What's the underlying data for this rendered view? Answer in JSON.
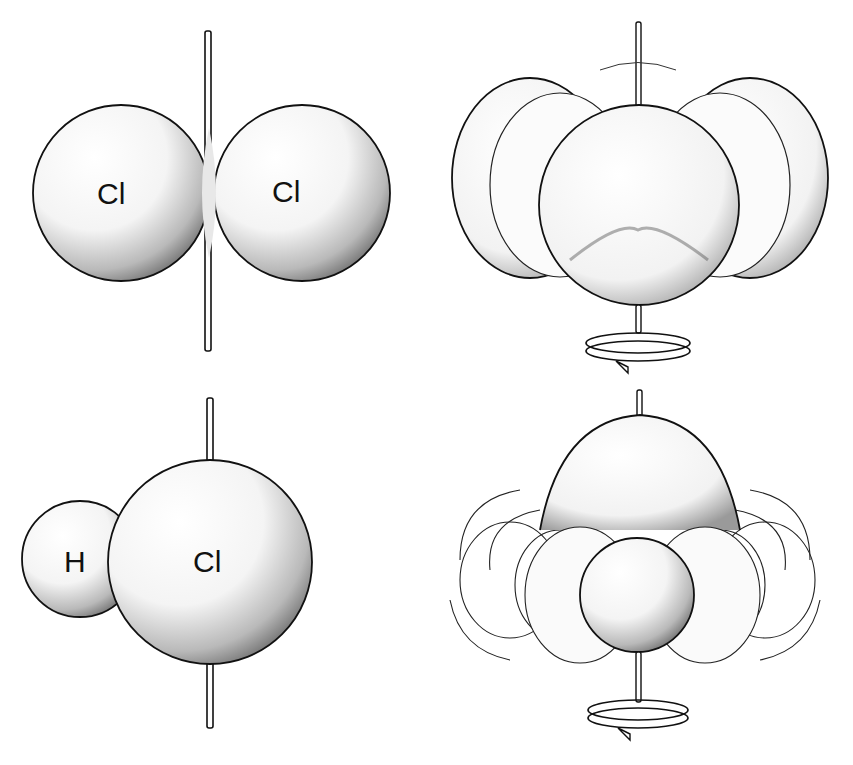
{
  "figure": {
    "panels": [
      {
        "id": "cl2-static",
        "description": "Cl2 molecule on vertical axis",
        "atoms": [
          {
            "label": "Cl"
          },
          {
            "label": "Cl"
          }
        ]
      },
      {
        "id": "cl2-rotating",
        "description": "Cl2 rotating about vertical axis (swept shapes)",
        "rotation_indicator": "rotation-arrow"
      },
      {
        "id": "hcl-static",
        "description": "HCl molecule on vertical axis",
        "atoms": [
          {
            "label": "H"
          },
          {
            "label": "Cl"
          }
        ]
      },
      {
        "id": "hcl-rotating",
        "description": "HCl rotating about vertical axis (swept shapes)",
        "rotation_indicator": "rotation-arrow"
      }
    ]
  },
  "colors": {
    "ink": "#111111",
    "background": "#ffffff"
  }
}
